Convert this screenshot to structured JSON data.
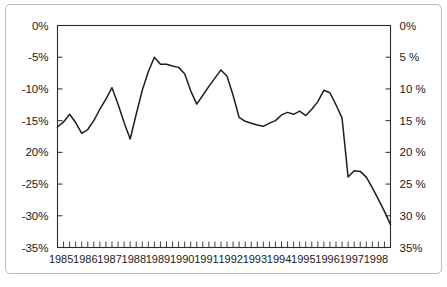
{
  "chart_data": {
    "type": "line",
    "title": "",
    "subtitle": "",
    "xlabel": "",
    "ylabel": "",
    "ylim": [
      -35,
      0
    ],
    "xlim": [
      1985,
      1998.75
    ],
    "grid": false,
    "legend": null,
    "y_axis_left": {
      "label": "",
      "ticks": [
        0,
        -5,
        -10,
        -15,
        -20,
        -25,
        -30,
        -35
      ],
      "tick_labels": [
        "0%",
        "-5%",
        "-10%",
        "-15%",
        "20%",
        "-25%",
        "-30%",
        "-35%"
      ]
    },
    "y_axis_right": {
      "label": "",
      "ticks": [
        0,
        -5,
        -10,
        -15,
        -20,
        -25,
        -30,
        -35
      ],
      "tick_labels": [
        "0%",
        "5 %",
        "10 %",
        "15 %",
        "20 %",
        "25 %",
        "30 %",
        "35%"
      ]
    },
    "x_axis": {
      "label": "",
      "tick_labels": [
        "1985",
        "1986",
        "1987",
        "1988",
        "1989",
        "1990",
        "1991",
        "1992",
        "1993",
        "1994",
        "1995",
        "1996",
        "1997",
        "1998"
      ],
      "minor_ticks_per_year": 4
    },
    "series": [
      {
        "name": "series-1",
        "color": "#1e1e1e",
        "x": [
          "1985Q1",
          "1985Q2",
          "1985Q3",
          "1985Q4",
          "1986Q1",
          "1986Q2",
          "1986Q3",
          "1986Q4",
          "1987Q1",
          "1987Q2",
          "1987Q3",
          "1987Q4",
          "1988Q1",
          "1988Q2",
          "1988Q3",
          "1988Q4",
          "1989Q1",
          "1989Q2",
          "1989Q3",
          "1989Q4",
          "1990Q1",
          "1990Q2",
          "1990Q3",
          "1990Q4",
          "1991Q1",
          "1991Q2",
          "1991Q3",
          "1991Q4",
          "1992Q1",
          "1992Q2",
          "1992Q3",
          "1992Q4",
          "1993Q1",
          "1993Q2",
          "1993Q3",
          "1993Q4",
          "1994Q1",
          "1994Q2",
          "1994Q3",
          "1994Q4",
          "1995Q1",
          "1995Q2",
          "1995Q3",
          "1995Q4",
          "1996Q1",
          "1996Q2",
          "1996Q3",
          "1996Q4",
          "1997Q1",
          "1997Q2",
          "1997Q3",
          "1997Q4",
          "1998Q1",
          "1998Q2",
          "1998Q3",
          "1998Q4"
        ],
        "values": [
          -16.0,
          -15.2,
          -14.0,
          -15.3,
          -17.0,
          -16.4,
          -15.0,
          -13.2,
          -11.6,
          -9.8,
          -12.4,
          -15.3,
          -17.9,
          -14.0,
          -10.2,
          -7.3,
          -5.0,
          -6.1,
          -6.1,
          -6.4,
          -6.6,
          -7.6,
          -10.3,
          -12.4,
          -11.0,
          -9.6,
          -8.3,
          -7.0,
          -8.0,
          -11.0,
          -14.5,
          -15.1,
          -15.4,
          -15.7,
          -15.9,
          -15.4,
          -15.0,
          -14.1,
          -13.7,
          -14.0,
          -13.5,
          -14.2,
          -13.2,
          -12.0,
          -10.2,
          -10.6,
          -12.5,
          -14.6,
          -16.8,
          -18.8,
          -19.2,
          -21.6,
          -24.0,
          -25.0,
          -24.9,
          -24.8
        ]
      }
    ],
    "series_tail": {
      "note": "continuation 1997-1998",
      "x": [
        "1997Q1",
        "1997Q2",
        "1997Q3",
        "1997Q4",
        "1998Q1",
        "1998Q2",
        "1998Q3",
        "1998Q4"
      ],
      "values": [
        -23.9,
        -22.9,
        -23.0,
        -23.9,
        -25.6,
        -27.4,
        -29.3,
        -31.4
      ]
    }
  }
}
